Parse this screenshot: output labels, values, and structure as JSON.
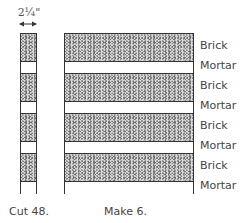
{
  "dimension": {
    "label": "2¼\""
  },
  "labels": [
    "Brick",
    "Mortar",
    "Brick",
    "Mortar",
    "Brick",
    "Mortar",
    "Brick",
    "Mortar"
  ],
  "captions": {
    "left": "Cut 48.",
    "right": "Make 6."
  },
  "colors": {
    "brick": "#6e6e6e",
    "mortar": "#ffffff",
    "outline": "#333333"
  }
}
